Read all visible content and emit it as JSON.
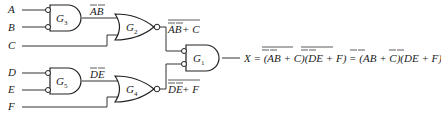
{
  "diagram": {
    "type": "logic-circuit",
    "inputs": [
      "A",
      "B",
      "C",
      "D",
      "E",
      "F"
    ],
    "gates": [
      {
        "id": "G3",
        "label": "G",
        "sub": "3",
        "kind": "negative-AND",
        "inputs": [
          "A",
          "B"
        ],
        "output_expr": "AB"
      },
      {
        "id": "G2",
        "label": "G",
        "sub": "2",
        "kind": "NOR",
        "inputs": [
          "G3",
          "C"
        ],
        "output_expr": "AB + C"
      },
      {
        "id": "G5",
        "label": "G",
        "sub": "5",
        "kind": "negative-AND",
        "inputs": [
          "D",
          "E"
        ],
        "output_expr": "DE"
      },
      {
        "id": "G4",
        "label": "G",
        "sub": "4",
        "kind": "NOR",
        "inputs": [
          "G5",
          "F"
        ],
        "output_expr": "DE + F"
      },
      {
        "id": "G1",
        "label": "G",
        "sub": "1",
        "kind": "negative-AND",
        "inputs": [
          "G2",
          "G4"
        ],
        "output_expr": "X"
      }
    ],
    "labels": {
      "g3_out": "AB",
      "g2_out_left": "AB",
      "g2_out_right": " + C",
      "g5_out": "DE",
      "g4_out_left": "DE",
      "g4_out_right": " + F"
    },
    "output_equation": {
      "prefix": "X = (",
      "t1": "AB",
      "t1b": " + C)(",
      "t2": "DE",
      "t2b": " + F) = (",
      "t3": "AB",
      "t3b": " + C)(",
      "t4": "DE",
      "t4b": " + F)"
    }
  }
}
